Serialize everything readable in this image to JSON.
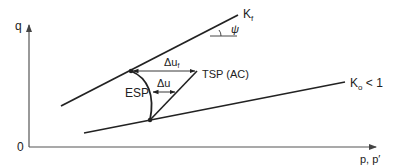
{
  "diagram": {
    "type": "stress-path",
    "axes": {
      "y_label": "q",
      "x_label": "p, p′",
      "origin_label": "0"
    },
    "lines": {
      "failure_line": {
        "label_main": "K",
        "label_sub": "f",
        "angle_label": "ψ"
      },
      "k0_line": {
        "label_main": "K",
        "label_sub": "o",
        "label_suffix": " < 1"
      }
    },
    "paths": {
      "esp": {
        "label": "ESP"
      },
      "tsp": {
        "label": "TSP (AC)"
      }
    },
    "arrows": {
      "delta_uf": {
        "label_main": "Δu",
        "label_sub": "f"
      },
      "delta_u": {
        "label": "Δu"
      }
    },
    "colors": {
      "ink": "#222222",
      "axis": "#555555",
      "background": "#ffffff"
    }
  }
}
